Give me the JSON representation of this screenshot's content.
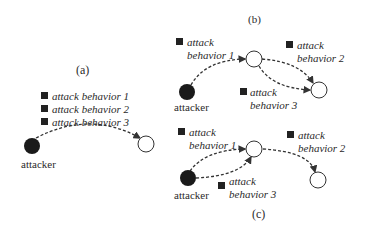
{
  "panels": {
    "a": {
      "label": "(a)",
      "behaviors": [
        "attack behavior 1",
        "attack behavior 2",
        "attack behavior 3"
      ],
      "attacker_label": "attacker"
    },
    "b": {
      "label": "(b)",
      "behavior1": [
        "attack",
        "behavior 1"
      ],
      "behavior2": [
        "attack",
        "behavior 2"
      ],
      "behavior3": [
        "attack",
        "behavior 3"
      ],
      "attacker_label": "attacker"
    },
    "c": {
      "label": "(c)",
      "behavior1": [
        "attack",
        "behavior 1"
      ],
      "behavior2": [
        "attack",
        "behavior 2"
      ],
      "behavior3": [
        "attack",
        "behavior 3"
      ],
      "attacker_label": "attacker"
    }
  },
  "colors": {
    "attacker_node": "#1a1a1a",
    "target_node": "#ffffff",
    "edge": "#333333"
  }
}
